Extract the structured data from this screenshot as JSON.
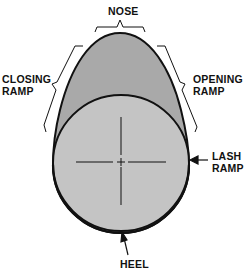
{
  "diagram": {
    "labels": {
      "nose": "NOSE",
      "closing_ramp_line1": "CLOSING",
      "closing_ramp_line2": "RAMP",
      "opening_ramp_line1": "OPENING",
      "opening_ramp_line2": "RAMP",
      "lash_ramp_line1": "LASH",
      "lash_ramp_line2": "RAMP",
      "heel": "HEEL"
    },
    "colors": {
      "lobe_fill": "#a9a9a9",
      "base_circle_fill": "#c4c4c4",
      "outline": "#111111",
      "background": "#ffffff"
    }
  }
}
